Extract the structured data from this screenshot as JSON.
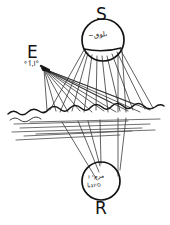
{
  "figure": {
    "kind": "hand-drawn-ray-diagram",
    "background_color": "#ffffff",
    "ink_color": "#141414",
    "ray_color": "#2a2a2a",
    "width": 170,
    "height": 225
  },
  "labels": {
    "source": "S",
    "emitter": "E",
    "receiver": "R"
  },
  "annotations": {
    "source_scribble": "~ىلوٯ",
    "emitter_scribble": "°ﺍ,ٱ°",
    "receiver_scribble_line1": "مرمי ו",
    "receiver_scribble_line2": "סיוגبا"
  },
  "nodes": [
    {
      "id": "source-node",
      "label": "S",
      "shape": "circle",
      "cx": 103,
      "cy": 40,
      "r": 21,
      "has_chord": true
    },
    {
      "id": "emitter-node",
      "label": "E",
      "shape": "point",
      "cx": 43,
      "cy": 68,
      "r": 2
    },
    {
      "id": "receiver-node",
      "label": "R",
      "shape": "circle",
      "cx": 101,
      "cy": 181,
      "r": 19,
      "has_chord": false
    }
  ],
  "surface": {
    "name": "water-surface",
    "baseline_y": 110,
    "hatch_count": 7
  },
  "icons": {
    "source": "circle-node-icon",
    "emitter": "point-node-icon",
    "receiver": "circle-node-icon",
    "surface": "wave-surface-icon",
    "rays": "ray-fan-icon"
  }
}
